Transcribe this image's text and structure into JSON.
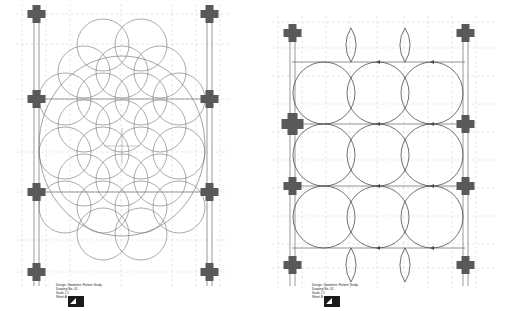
{
  "page": {
    "background": "#ffffff",
    "width": 520,
    "height": 311,
    "line_color": "#6d6d6d",
    "dash_color": "#b5b5b5",
    "node_color": "#58595b",
    "stroke_color": "#4d4d4d"
  },
  "panels": [
    {
      "id": "left",
      "name": "overlapping-circle-grid-drawing",
      "caption": "Design: Geometric Pattern Study\nDrawing No. 01\nScale 1:1\nSheet A",
      "logo_alt": "studio-logo",
      "nodes": [
        {
          "col": 0,
          "row": 0
        },
        {
          "col": 1,
          "row": 0
        },
        {
          "col": 0,
          "row": 1
        },
        {
          "col": 1,
          "row": 1
        },
        {
          "col": 0,
          "row": 2
        },
        {
          "col": 1,
          "row": 2
        },
        {
          "col": 0,
          "row": 3
        },
        {
          "col": 1,
          "row": 3
        }
      ],
      "geometry": {
        "type": "circle-lattice",
        "circle_radius": 26,
        "grid_cols": 4,
        "grid_rows": 5,
        "outer_ellipse": true
      }
    },
    {
      "id": "right",
      "name": "arc-cusp-grid-drawing",
      "caption": "Design: Geometric Pattern Study\nDrawing No. 02\nScale 1:1\nSheet B",
      "logo_alt": "studio-logo",
      "nodes": [
        {
          "col": 0,
          "row": 0
        },
        {
          "col": 1,
          "row": 0
        },
        {
          "col": 0,
          "row": 1
        },
        {
          "col": 1,
          "row": 1
        },
        {
          "col": 0,
          "row": 2
        },
        {
          "col": 1,
          "row": 2
        },
        {
          "col": 0,
          "row": 3
        },
        {
          "col": 1,
          "row": 3
        }
      ],
      "geometry": {
        "type": "arc-lattice",
        "arc_radius": 26,
        "grid_cols": 4,
        "grid_rows": 5,
        "horizontal_rules": 4
      }
    }
  ]
}
